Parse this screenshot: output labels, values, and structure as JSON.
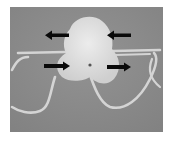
{
  "figure": {
    "background_color": "#8a8a8a",
    "specimen_color": "#e2e2e2",
    "thread_color": "#d6d6d6",
    "arrow_color": "#0a0a0a",
    "arrows": [
      {
        "id": "top-left",
        "direction": "left"
      },
      {
        "id": "top-right",
        "direction": "left"
      },
      {
        "id": "bottom-left",
        "direction": "right"
      },
      {
        "id": "bottom-right",
        "direction": "right"
      }
    ]
  }
}
